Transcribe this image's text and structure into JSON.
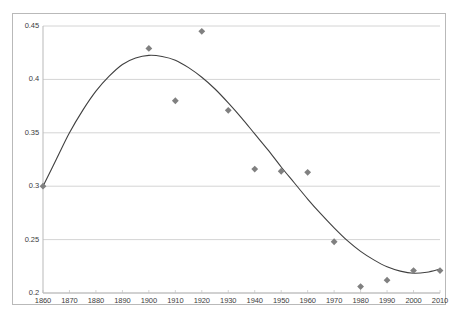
{
  "chart_data": {
    "type": "scatter",
    "title": "",
    "subtitle": "",
    "xlabel": "",
    "ylabel": "",
    "xlim": [
      1860,
      2010
    ],
    "ylim": [
      0.2,
      0.45
    ],
    "grid": true,
    "legend": false,
    "legend_position": "none",
    "marker_shape": "diamond",
    "marker_color": "#808080",
    "trendline_color": "#404040",
    "axis_color": "#b9b9b9",
    "gridline_color": "#d4d4d4",
    "x_ticks": [
      1860,
      1870,
      1880,
      1890,
      1900,
      1910,
      1920,
      1930,
      1940,
      1950,
      1960,
      1970,
      1980,
      1990,
      2000,
      2010
    ],
    "x_tick_labels": [
      "1860",
      "1870",
      "1880",
      "1890",
      "1900",
      "1910",
      "1920",
      "1930",
      "1940",
      "1950",
      "1960",
      "1970",
      "1980",
      "1990",
      "2000",
      "2010"
    ],
    "y_ticks": [
      0.2,
      0.25,
      0.3,
      0.35,
      0.4,
      0.45
    ],
    "y_tick_labels": [
      "0.2",
      "0.25",
      "0.3",
      "0.35",
      "0.4",
      "0.45"
    ],
    "x": [
      1860,
      1900,
      1910,
      1920,
      1930,
      1940,
      1950,
      1960,
      1970,
      1980,
      1990,
      2000,
      2010
    ],
    "values": [
      0.3,
      0.429,
      0.38,
      0.445,
      0.371,
      0.316,
      0.314,
      0.313,
      0.248,
      0.206,
      0.212,
      0.221,
      0.221
    ],
    "series": [
      {
        "name": "observations",
        "x": [
          1860,
          1900,
          1910,
          1920,
          1930,
          1940,
          1950,
          1960,
          1970,
          1980,
          1990,
          2000,
          2010
        ],
        "values": [
          0.3,
          0.429,
          0.38,
          0.445,
          0.371,
          0.316,
          0.314,
          0.313,
          0.248,
          0.206,
          0.212,
          0.221,
          0.221
        ]
      },
      {
        "name": "fitted-trend",
        "type": "line",
        "x": [
          1860,
          1865,
          1870,
          1875,
          1880,
          1885,
          1890,
          1895,
          1900,
          1905,
          1910,
          1915,
          1920,
          1925,
          1930,
          1935,
          1940,
          1945,
          1950,
          1955,
          1960,
          1965,
          1970,
          1975,
          1980,
          1985,
          1990,
          1995,
          2000,
          2005,
          2010
        ],
        "values": [
          0.3,
          0.325,
          0.35,
          0.371,
          0.389,
          0.403,
          0.414,
          0.42,
          0.4225,
          0.4215,
          0.418,
          0.411,
          0.402,
          0.391,
          0.378,
          0.364,
          0.349,
          0.334,
          0.318,
          0.303,
          0.288,
          0.274,
          0.261,
          0.249,
          0.239,
          0.231,
          0.2245,
          0.2205,
          0.2185,
          0.2195,
          0.2225
        ]
      }
    ]
  }
}
